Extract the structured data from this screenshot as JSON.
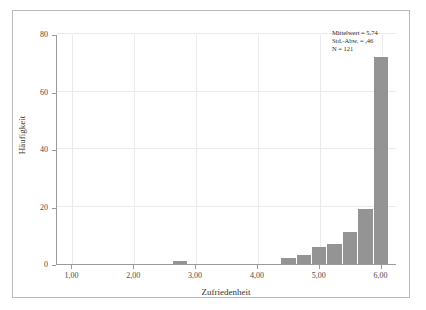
{
  "chart_data": {
    "type": "bar",
    "title": "",
    "xlabel": "Zufriedenheit",
    "ylabel": "Häufigkeit",
    "xlim": [
      0.75,
      6.25
    ],
    "ylim": [
      0,
      80
    ],
    "grid": true,
    "legend": "none",
    "bin_width": 0.25,
    "categories": [
      "2.75",
      "4.50",
      "4.75",
      "5.00",
      "5.25",
      "5.50",
      "5.75",
      "6.00"
    ],
    "x": [
      2.75,
      4.5,
      4.75,
      5.0,
      5.25,
      5.5,
      5.75,
      6.0
    ],
    "values": [
      1,
      2,
      3,
      6,
      7,
      11,
      19,
      72
    ],
    "series": [
      {
        "name": "Häufigkeit",
        "values": [
          1,
          2,
          3,
          6,
          7,
          11,
          19,
          72
        ],
        "color": "#949494"
      }
    ],
    "xticks": [
      1.0,
      2.0,
      3.0,
      4.0,
      5.0,
      6.0
    ],
    "xtick_labels": [
      "1,00",
      "2,00",
      "3,00",
      "4,00",
      "5,00",
      "6,00"
    ],
    "yticks": [
      0,
      20,
      40,
      60,
      80
    ],
    "ytick_labels": [
      "0",
      "20",
      "40",
      "60",
      "80"
    ],
    "annotations": [
      "Mittelwert = 5,74",
      "Std.-Abw. = ,46",
      "N = 121"
    ]
  },
  "axes": {
    "x_title": "Zufriedenheit",
    "y_title": "Häufigkeit"
  },
  "stats": {
    "mean_line": "Mittelwert = 5,74",
    "sd_line": "Std.-Abw. = ,46",
    "n_line": "N = 121"
  },
  "colors": {
    "bar": "#949494",
    "axis": "#9a9a9a",
    "grid": "#ebebeb",
    "frame": "#b9b9b9",
    "text": "#333333"
  }
}
